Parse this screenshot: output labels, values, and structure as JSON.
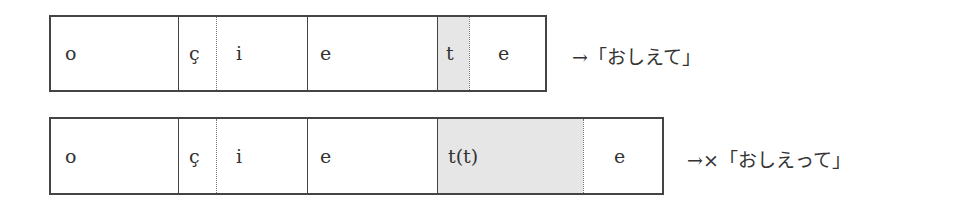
{
  "rows": [
    {
      "segments": [
        "o",
        "ç",
        "i",
        "e",
        "t",
        "e"
      ],
      "result": "→「おしえて」"
    },
    {
      "segments": [
        "o",
        "ç",
        "i",
        "e",
        "t(t)",
        "e"
      ],
      "result": "→×「おしえって」"
    }
  ],
  "colors": {
    "border": "#444444",
    "shade": "#e6e6e6"
  }
}
